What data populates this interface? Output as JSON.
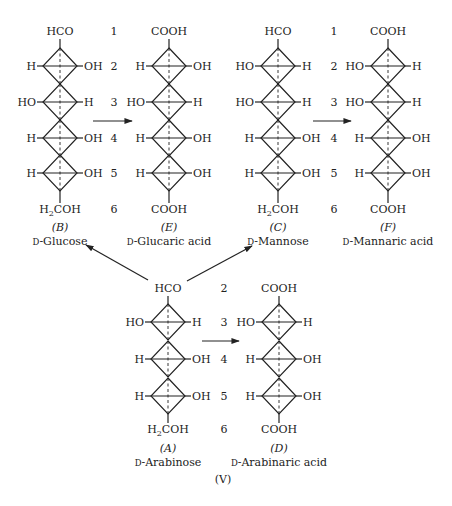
{
  "figure_label": "(V)",
  "structures": [
    {
      "id": "B",
      "letter": "(B)",
      "name": "D-Glucose",
      "name_prefix": "D",
      "name_rest": "-Glucose",
      "top": "HCO",
      "bottom": "H2COH",
      "rows": [
        [
          "H",
          "OH"
        ],
        [
          "HO",
          "H"
        ],
        [
          "H",
          "OH"
        ],
        [
          "H",
          "OH"
        ]
      ]
    },
    {
      "id": "E",
      "letter": "(E)",
      "name": "D-Glucaric acid",
      "name_prefix": "D",
      "name_rest": "-Glucaric acid",
      "top": "COOH",
      "bottom": "COOH",
      "rows": [
        [
          "H",
          "OH"
        ],
        [
          "HO",
          "H"
        ],
        [
          "H",
          "OH"
        ],
        [
          "H",
          "OH"
        ]
      ]
    },
    {
      "id": "C",
      "letter": "(C)",
      "name": "D-Mannose",
      "name_prefix": "D",
      "name_rest": "-Mannose",
      "top": "HCO",
      "bottom": "H2COH",
      "rows": [
        [
          "HO",
          "H"
        ],
        [
          "HO",
          "H"
        ],
        [
          "H",
          "OH"
        ],
        [
          "H",
          "OH"
        ]
      ]
    },
    {
      "id": "F",
      "letter": "(F)",
      "name": "D-Mannaric acid",
      "name_prefix": "D",
      "name_rest": "-Mannaric acid",
      "top": "COOH",
      "bottom": "COOH",
      "rows": [
        [
          "HO",
          "H"
        ],
        [
          "HO",
          "H"
        ],
        [
          "H",
          "OH"
        ],
        [
          "H",
          "OH"
        ]
      ]
    },
    {
      "id": "A",
      "letter": "(A)",
      "name": "D-Arabinose",
      "name_prefix": "D",
      "name_rest": "-Arabinose",
      "top": "HCO",
      "bottom": "H2COH",
      "rows": [
        [
          "HO",
          "H"
        ],
        [
          "H",
          "OH"
        ],
        [
          "H",
          "OH"
        ]
      ]
    },
    {
      "id": "D",
      "letter": "(D)",
      "name": "D-Arabinaric acid",
      "name_prefix": "D",
      "name_rest": "-Arabinaric acid",
      "top": "COOH",
      "bottom": "COOH",
      "rows": [
        [
          "HO",
          "H"
        ],
        [
          "H",
          "OH"
        ],
        [
          "H",
          "OH"
        ]
      ]
    }
  ],
  "carbon_numbers_hexose": [
    "1",
    "2",
    "3",
    "4",
    "5",
    "6"
  ],
  "carbon_numbers_pentose": [
    "2",
    "3",
    "4",
    "5",
    "6"
  ],
  "reactions": [
    {
      "from": "B",
      "to": "E",
      "label": "oxidation"
    },
    {
      "from": "C",
      "to": "F",
      "label": "oxidation"
    },
    {
      "from": "A",
      "to": "D",
      "label": "oxidation"
    },
    {
      "from": "A",
      "to": "B",
      "label": "chain extension"
    },
    {
      "from": "A",
      "to": "C",
      "label": "chain extension"
    }
  ],
  "colors": {
    "ink": "#222222",
    "background": "#ffffff"
  }
}
